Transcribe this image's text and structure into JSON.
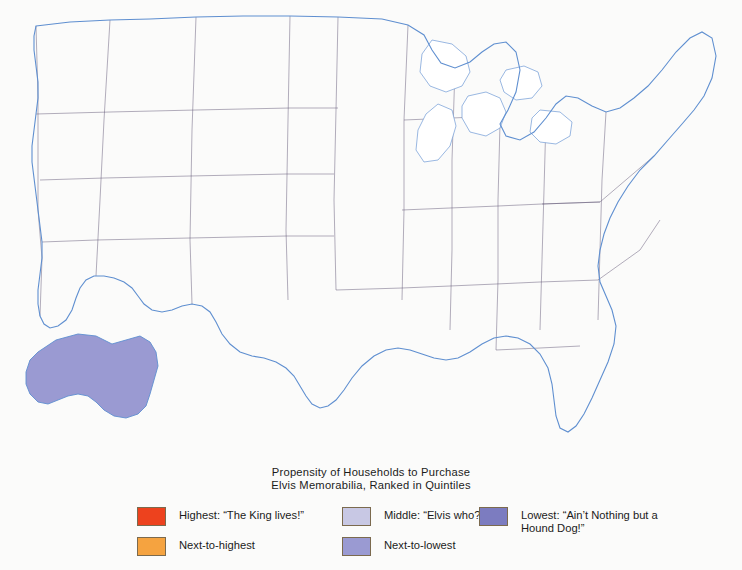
{
  "caption": {
    "line1": "Propensity of Households to Purchase",
    "line2": "Elvis Memorabilia, Ranked in Quintiles"
  },
  "legend": {
    "items": [
      {
        "label": "Highest: “The King lives!”",
        "color": "#ed421e",
        "column": 1,
        "row": 1
      },
      {
        "label": "Next-to-highest",
        "color": "#f5a340",
        "column": 1,
        "row": 2
      },
      {
        "label": "Middle: “Elvis who?”",
        "color": "#c8c8e4",
        "column": 2,
        "row": 1
      },
      {
        "label": "Next-to-lowest",
        "color": "#9a9ad2",
        "column": 2,
        "row": 2
      },
      {
        "label": "Lowest: “Ain’t Nothing but a\nHound Dog!”",
        "color": "#7c7cc0",
        "column": 3,
        "row": 1
      }
    ]
  },
  "map": {
    "background_color": "#fbfbfa",
    "water_color": "#ffffff",
    "coast_color": "#5f8fd0",
    "county_border_color": "#8d7fa8",
    "state_border_color": "#5a4f70",
    "insets": [
      "alaska",
      "hawaii"
    ],
    "quintile_colors": {
      "highest": "#ed421e",
      "next_to_highest": "#f5a340",
      "middle": "#c8c8e4",
      "next_to_lowest": "#9a9ad2",
      "lowest": "#7c7cc0"
    }
  },
  "chart_data": {
    "type": "map",
    "title": "Propensity of Households to Purchase Elvis Memorabilia, Ranked in Quintiles",
    "classification": "quintile choropleth",
    "unit": "US county",
    "legend_entries": [
      "Highest: “The King lives!”",
      "Next-to-highest",
      "Middle: “Elvis who?”",
      "Next-to-lowest",
      "Lowest: “Ain’t Nothing but a Hound Dog!”"
    ],
    "regional_pattern": [
      {
        "region": "Deep South (MS, AL, GA, TN, AR, LA)",
        "dominant_class": "Highest"
      },
      {
        "region": "Appalachia and Ohio Valley",
        "dominant_class": "Highest"
      },
      {
        "region": "Mid-Atlantic and New England interior",
        "dominant_class": "Highest"
      },
      {
        "region": "Lower Midwest (MO, KY, IN, OH)",
        "dominant_class": "Highest"
      },
      {
        "region": "Upper Great Plains (ND, SD, NE, MT, WY)",
        "dominant_class": "Next-to-lowest"
      },
      {
        "region": "Intermountain West (UT, NV, ID, CO)",
        "dominant_class": "Next-to-lowest"
      },
      {
        "region": "Florida peninsula",
        "dominant_class": "Next-to-lowest"
      },
      {
        "region": "Urban coastal California",
        "dominant_class": "Lowest"
      },
      {
        "region": "South Texas / border counties",
        "dominant_class": "Next-to-lowest"
      },
      {
        "region": "Alaska",
        "dominant_class": "Next-to-lowest"
      }
    ]
  }
}
